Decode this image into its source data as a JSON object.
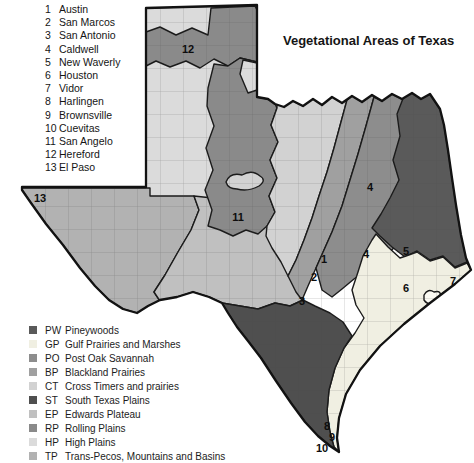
{
  "title": "Vegetational Areas of Texas",
  "cities": [
    {
      "num": "1",
      "name": "Austin"
    },
    {
      "num": "2",
      "name": "San Marcos"
    },
    {
      "num": "3",
      "name": "San Antonio"
    },
    {
      "num": "4",
      "name": "Caldwell"
    },
    {
      "num": "5",
      "name": "New Waverly"
    },
    {
      "num": "6",
      "name": "Houston"
    },
    {
      "num": "7",
      "name": "Vidor"
    },
    {
      "num": "8",
      "name": "Harlingen"
    },
    {
      "num": "9",
      "name": "Brownsville"
    },
    {
      "num": "10",
      "name": "Cuevitas"
    },
    {
      "num": "11",
      "name": "San Angelo"
    },
    {
      "num": "12",
      "name": "Hereford"
    },
    {
      "num": "13",
      "name": "El Paso"
    }
  ],
  "legend": {
    "items": [
      {
        "code": "PW",
        "name": "Pineywoods"
      },
      {
        "code": "GP",
        "name": "Gulf Prairies and Marshes"
      },
      {
        "code": "PO",
        "name": "Post Oak Savannah"
      },
      {
        "code": "BP",
        "name": "Blackland Prairies"
      },
      {
        "code": "CT",
        "name": "Cross Timers and prairies"
      },
      {
        "code": "ST",
        "name": "South Texas Plains"
      },
      {
        "code": "EP",
        "name": "Edwards Plateau"
      },
      {
        "code": "RP",
        "name": "Rolling Plains"
      },
      {
        "code": "HP",
        "name": "High Plains"
      },
      {
        "code": "TP",
        "name": "Trans-Pecos, Mountains and Basins"
      }
    ]
  },
  "map": {
    "markers": [
      {
        "label": "1"
      },
      {
        "label": "2"
      },
      {
        "label": "3"
      },
      {
        "label": "4"
      },
      {
        "label": "4"
      },
      {
        "label": "5"
      },
      {
        "label": "6"
      },
      {
        "label": "7"
      },
      {
        "label": "8"
      },
      {
        "label": "9"
      },
      {
        "label": "10"
      },
      {
        "label": "11"
      },
      {
        "label": "12"
      },
      {
        "label": "13"
      }
    ]
  },
  "palette": {
    "PW": "#5a5a5a",
    "GP": "#f0efe2",
    "PO": "#8d8d8d",
    "BP": "#a0a0a0",
    "CT": "#d2d2d2",
    "ST": "#4f4f4f",
    "EP": "#c0c0c0",
    "RP": "#8a8a8a",
    "HP": "#dbdbdb",
    "TP": "#b2b2b2",
    "bay": "#fbfaf2",
    "outline": "#1a1a1a"
  }
}
